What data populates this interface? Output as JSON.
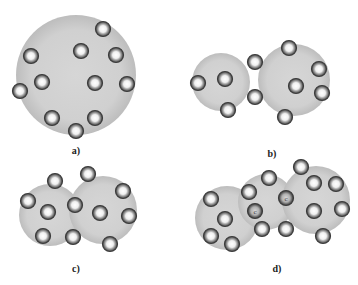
{
  "colors": {
    "background": "#ffffff",
    "cluster_fill": "#c8c8c8",
    "cluster_inner": "#d4d4d4",
    "ball_ring": "#4a4a4a",
    "ball_center": "#ffffff"
  },
  "panels": [
    {
      "label": "a)",
      "label_pos": [
        76,
        153
      ],
      "clusters": [
        {
          "cx": 76,
          "cy": 75,
          "r": 60
        }
      ],
      "balls": [
        [
          103,
          29,
          ""
        ],
        [
          31,
          56,
          ""
        ],
        [
          81,
          51,
          ""
        ],
        [
          116,
          55,
          ""
        ],
        [
          42,
          82,
          ""
        ],
        [
          95,
          83,
          ""
        ],
        [
          127,
          84,
          ""
        ],
        [
          20,
          91,
          ""
        ],
        [
          52,
          118,
          ""
        ],
        [
          95,
          118,
          ""
        ],
        [
          76,
          131,
          ""
        ]
      ]
    },
    {
      "label": "b)",
      "label_pos": [
        272,
        156
      ],
      "clusters": [
        {
          "cx": 221,
          "cy": 82,
          "r": 29
        },
        {
          "cx": 294,
          "cy": 80,
          "r": 36
        }
      ],
      "balls": [
        [
          255,
          62,
          ""
        ],
        [
          198,
          83,
          ""
        ],
        [
          225,
          79,
          ""
        ],
        [
          228,
          110,
          ""
        ],
        [
          255,
          97,
          ""
        ],
        [
          289,
          48,
          ""
        ],
        [
          319,
          69,
          ""
        ],
        [
          296,
          86,
          ""
        ],
        [
          322,
          93,
          ""
        ],
        [
          285,
          117,
          ""
        ]
      ]
    },
    {
      "label": "c)",
      "label_pos": [
        76,
        271
      ],
      "clusters": [
        {
          "cx": 50,
          "cy": 215,
          "r": 31
        },
        {
          "cx": 103,
          "cy": 210,
          "r": 34
        }
      ],
      "balls": [
        [
          55,
          181,
          ""
        ],
        [
          88,
          174,
          ""
        ],
        [
          28,
          201,
          ""
        ],
        [
          123,
          191,
          ""
        ],
        [
          48,
          212,
          ""
        ],
        [
          75,
          205,
          ""
        ],
        [
          100,
          213,
          ""
        ],
        [
          129,
          216,
          ""
        ],
        [
          43,
          236,
          ""
        ],
        [
          73,
          237,
          ""
        ],
        [
          110,
          244,
          ""
        ]
      ]
    },
    {
      "label": "d)",
      "label_pos": [
        277,
        271
      ],
      "clusters": [
        {
          "cx": 227,
          "cy": 218,
          "r": 32
        },
        {
          "cx": 266,
          "cy": 202,
          "r": 28
        },
        {
          "cx": 316,
          "cy": 200,
          "r": 34
        }
      ],
      "balls": [
        [
          301,
          167,
          ""
        ],
        [
          269,
          178,
          ""
        ],
        [
          314,
          183,
          ""
        ],
        [
          336,
          184,
          ""
        ],
        [
          249,
          192,
          ""
        ],
        [
          286,
          198,
          "c"
        ],
        [
          211,
          199,
          ""
        ],
        [
          342,
          209,
          ""
        ],
        [
          255,
          211,
          "c"
        ],
        [
          314,
          211,
          ""
        ],
        [
          225,
          219,
          ""
        ],
        [
          262,
          229,
          ""
        ],
        [
          286,
          229,
          ""
        ],
        [
          323,
          236,
          ""
        ],
        [
          211,
          236,
          ""
        ],
        [
          232,
          244,
          ""
        ]
      ]
    }
  ]
}
